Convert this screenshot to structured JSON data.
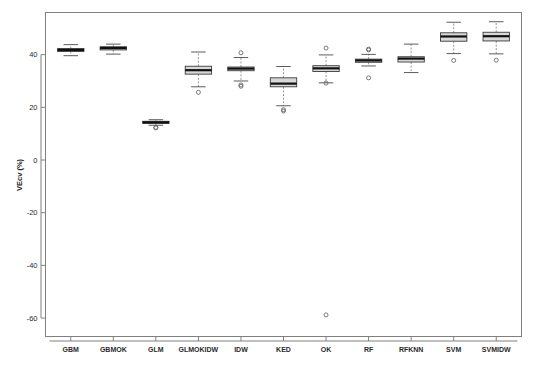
{
  "figure": {
    "background": "#ffffff",
    "frame_color": "#808080",
    "box_fill": "#d8d8d8",
    "median_color": "#111111",
    "outlier_color": "#5a5a5a"
  },
  "chart_data": {
    "type": "box",
    "title": "",
    "xlabel": "",
    "ylabel": "VEcv (%)",
    "ylim": [
      -67,
      56
    ],
    "yticks": [
      40,
      20,
      0,
      -20,
      -40,
      -60
    ],
    "ytick_labels": [
      "40",
      "20",
      "0",
      "-20",
      "-40",
      "-60"
    ],
    "grid": false,
    "legend": null,
    "categories": [
      "GBM",
      "GBMOK",
      "GLM",
      "GLMOKIDW",
      "IDW",
      "KED",
      "OK",
      "RF",
      "RFKNN",
      "SVM",
      "SVMIDW"
    ],
    "boxes": [
      {
        "name": "GBM",
        "min_whisker": 39.6,
        "q1": 41.2,
        "median": 41.8,
        "q3": 42.3,
        "max_whisker": 43.8,
        "outliers": []
      },
      {
        "name": "GBMOK",
        "min_whisker": 40.2,
        "q1": 41.8,
        "median": 42.5,
        "q3": 43.0,
        "max_whisker": 44.0,
        "outliers": []
      },
      {
        "name": "GLM",
        "min_whisker": 13.2,
        "q1": 13.9,
        "median": 14.3,
        "q3": 14.7,
        "max_whisker": 15.3,
        "outliers": [
          12.4,
          12.2
        ]
      },
      {
        "name": "GLMOKIDW",
        "min_whisker": 27.8,
        "q1": 32.6,
        "median": 34.1,
        "q3": 35.6,
        "max_whisker": 41.0,
        "outliers": [
          25.7
        ]
      },
      {
        "name": "IDW",
        "min_whisker": 30.0,
        "q1": 33.9,
        "median": 34.7,
        "q3": 35.3,
        "max_whisker": 38.9,
        "outliers": [
          40.7,
          28.5,
          28.0
        ]
      },
      {
        "name": "KED",
        "min_whisker": 20.6,
        "q1": 27.8,
        "median": 29.0,
        "q3": 31.2,
        "max_whisker": 35.5,
        "outliers": [
          19.1,
          18.6
        ]
      },
      {
        "name": "OK",
        "min_whisker": 29.3,
        "q1": 33.6,
        "median": 34.8,
        "q3": 35.8,
        "max_whisker": 39.9,
        "outliers": [
          42.5,
          29.2,
          -58.8
        ]
      },
      {
        "name": "RF",
        "min_whisker": 35.7,
        "q1": 37.1,
        "median": 37.8,
        "q3": 38.3,
        "max_whisker": 40.1,
        "outliers": [
          42.1,
          41.8,
          31.2
        ]
      },
      {
        "name": "RFKNN",
        "min_whisker": 33.2,
        "q1": 37.2,
        "median": 38.5,
        "q3": 39.2,
        "max_whisker": 44.0,
        "outliers": []
      },
      {
        "name": "SVM",
        "min_whisker": 40.4,
        "q1": 45.1,
        "median": 46.9,
        "q3": 48.3,
        "max_whisker": 52.3,
        "outliers": [
          37.8
        ]
      },
      {
        "name": "SVMIDW",
        "min_whisker": 40.3,
        "q1": 45.2,
        "median": 47.0,
        "q3": 48.5,
        "max_whisker": 52.5,
        "outliers": [
          37.9
        ]
      }
    ]
  }
}
